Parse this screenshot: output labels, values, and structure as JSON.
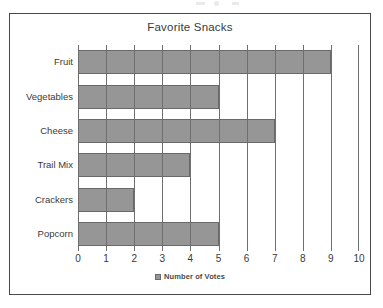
{
  "chart_data": {
    "type": "bar",
    "orientation": "horizontal",
    "title": "Favorite Snacks",
    "categories": [
      "Fruit",
      "Vegetables",
      "Cheese",
      "Trail Mix",
      "Crackers",
      "Popcorn"
    ],
    "values": [
      9,
      5,
      7,
      4,
      2,
      5
    ],
    "series": [
      {
        "name": "Number of Votes",
        "values": [
          9,
          5,
          7,
          4,
          2,
          5
        ]
      }
    ],
    "xlabel": "",
    "ylabel": "",
    "xlim": [
      0,
      10
    ],
    "xticks": [
      0,
      1,
      2,
      3,
      4,
      5,
      6,
      7,
      8,
      9,
      10
    ],
    "xtick_labels": [
      "0",
      "1",
      "2",
      "3",
      "4",
      "5",
      "6",
      "7",
      "8",
      "9",
      "10"
    ],
    "grid": "vertical",
    "legend": {
      "position": "bottom-center",
      "entries": [
        "Number of Votes"
      ]
    },
    "colors": {
      "bar_fill": "#969696",
      "bar_border": "#6a6a6a",
      "gridline": "#6f6f6f",
      "frame": "#4a4a4a",
      "text": "#3a3a3a"
    }
  }
}
